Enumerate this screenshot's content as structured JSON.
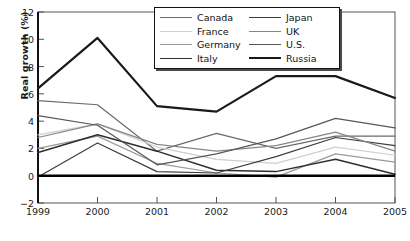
{
  "chart_data": {
    "type": "line",
    "title": "",
    "xlabel": "",
    "ylabel": "Real growth (%)",
    "x": [
      1999,
      2000,
      2001,
      2002,
      2003,
      2004,
      2005
    ],
    "xtick_labels": [
      "1999",
      "2000",
      "2001",
      "2002",
      "2003",
      "2004",
      "2005"
    ],
    "ytick_labels": [
      "12",
      "10",
      "8",
      "6",
      "4",
      "2",
      "0",
      "-2"
    ],
    "ytick_values": [
      12,
      10,
      8,
      6,
      4,
      2,
      0,
      -2
    ],
    "ylim": [
      -2,
      12
    ],
    "xlim": [
      1999,
      2005
    ],
    "grid": false,
    "legend_position": "top-center",
    "zero_line": 0,
    "series": [
      {
        "name": "Canada",
        "color": "#6b6b6b",
        "width": 1.2,
        "values": [
          5.5,
          5.2,
          1.8,
          3.1,
          2.0,
          2.9,
          2.9
        ]
      },
      {
        "name": "France",
        "color": "#cfcfcf",
        "width": 1.2,
        "values": [
          3.0,
          3.8,
          2.1,
          1.2,
          0.9,
          2.1,
          1.5
        ]
      },
      {
        "name": "Germany",
        "color": "#9a9a9a",
        "width": 1.2,
        "values": [
          2.0,
          2.9,
          0.9,
          0.2,
          -0.1,
          1.6,
          1.0
        ]
      },
      {
        "name": "Italy",
        "color": "#2e2e2e",
        "width": 1.5,
        "values": [
          1.7,
          3.0,
          1.8,
          0.4,
          0.3,
          1.2,
          0.1
        ]
      },
      {
        "name": "Japan",
        "color": "#3d3d3d",
        "width": 1.2,
        "values": [
          -0.1,
          2.4,
          0.3,
          0.2,
          1.4,
          2.8,
          2.2
        ]
      },
      {
        "name": "UK",
        "color": "#868686",
        "width": 1.2,
        "values": [
          2.8,
          3.8,
          2.3,
          1.8,
          2.2,
          3.2,
          1.8
        ]
      },
      {
        "name": "U.S.",
        "color": "#575757",
        "width": 1.2,
        "values": [
          4.4,
          3.7,
          0.8,
          1.6,
          2.7,
          4.2,
          3.5
        ]
      },
      {
        "name": "Russia",
        "color": "#1a1a1a",
        "width": 2.2,
        "values": [
          6.4,
          10.1,
          5.1,
          4.7,
          7.3,
          7.3,
          5.7
        ]
      }
    ]
  },
  "legend": {
    "items": [
      {
        "label": "Canada"
      },
      {
        "label": "Japan"
      },
      {
        "label": "France"
      },
      {
        "label": "UK"
      },
      {
        "label": "Germany"
      },
      {
        "label": "U.S."
      },
      {
        "label": "Italy"
      },
      {
        "label": "Russia"
      }
    ]
  }
}
